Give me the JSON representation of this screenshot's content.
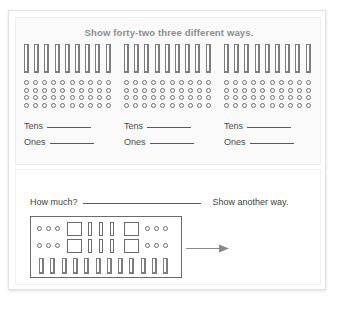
{
  "worksheet": {
    "title": "Show forty-two three different ways.",
    "columns": [
      {
        "rods": 9,
        "dot_rows": 4,
        "dot_cols": 10,
        "tens_label": "Tens",
        "ones_label": "Ones"
      },
      {
        "rods": 9,
        "dot_rows": 4,
        "dot_cols": 10,
        "tens_label": "Tens",
        "ones_label": "Ones"
      },
      {
        "rods": 9,
        "dot_rows": 4,
        "dot_cols": 10,
        "tens_label": "Tens",
        "ones_label": "Ones"
      }
    ],
    "question": {
      "prompt": "How much?",
      "secondary_prompt": "Show another way."
    },
    "blocks_box": {
      "rows": [
        {
          "left_dots": 3,
          "flats_left": 1,
          "rods": 3,
          "flats_right": 1,
          "right_dots": 3
        },
        {
          "left_dots": 3,
          "flats_left": 1,
          "rods": 3,
          "flats_right": 1,
          "right_dots": 3
        }
      ],
      "bottom_rods": 12
    },
    "arrow_direction": "right"
  },
  "colors": {
    "page_background": "#ffffff",
    "panel_background": "#fafafa",
    "frame_border": "#e2e2e2",
    "title_text": "#8d8d8d",
    "body_text": "#3f3f3f",
    "block_outline": "#6b6b6b"
  }
}
